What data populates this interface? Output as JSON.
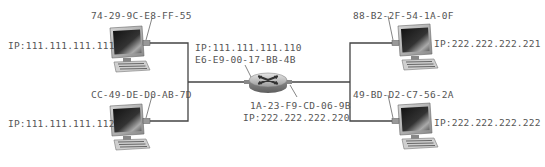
{
  "diagram": {
    "type": "network-topology",
    "subnets": [
      {
        "name": "left-subnet",
        "hosts": [
          {
            "mac": "74-29-9C-E8-FF-55",
            "ip": "IP:111.111.111.111"
          },
          {
            "mac": "CC-49-DE-D0-AB-7D",
            "ip": "IP:111.111.111.112"
          }
        ]
      },
      {
        "name": "right-subnet",
        "hosts": [
          {
            "mac": "88-B2-2F-54-1A-0F",
            "ip": "IP:222.222.222.221"
          },
          {
            "mac": "49-BD-D2-C7-56-2A",
            "ip": "IP:222.222.222.222"
          }
        ]
      }
    ],
    "router": {
      "left_interface": {
        "ip": "IP:111.111.111.110",
        "mac": "E6-E9-00-17-BB-4B"
      },
      "right_interface": {
        "mac": "1A-23-F9-CD-06-9B",
        "ip": "IP:222.222.222.220"
      }
    },
    "colors": {
      "line": "#444444",
      "text": "#555555",
      "background": "#ffffff"
    }
  }
}
